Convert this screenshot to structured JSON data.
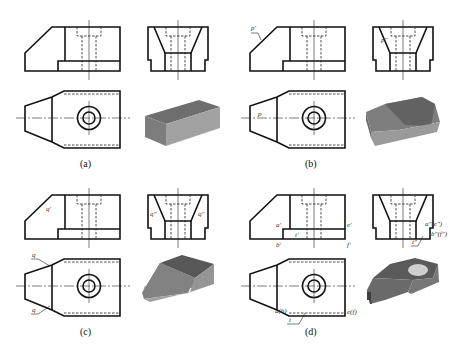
{
  "figure": {
    "panels": [
      {
        "id": "a",
        "caption": "(a)",
        "labels": []
      },
      {
        "id": "b",
        "caption": "(b)",
        "labels": {
          "front": "p'",
          "side": "p\"",
          "top": "p"
        }
      },
      {
        "id": "c",
        "caption": "(c)",
        "labels": {
          "front": "q'",
          "side_left": "q\"",
          "side_right": "q\"",
          "top_upper": "q",
          "top_lower": "q"
        }
      },
      {
        "id": "d",
        "caption": "(d)",
        "labels": {
          "front_a": "a'",
          "front_b": "b'",
          "front_t": "t'",
          "front_e": "e'",
          "front_f": "f'",
          "side_ae": "a\"(e\")",
          "side_bf": "b\"(f\")",
          "side_t": "t\"",
          "top_ab": "a(b)",
          "top_ef": "e(f)",
          "top_t": "t"
        }
      }
    ],
    "colors": {
      "line": "#111111",
      "solid_top": "#6e6e6e",
      "solid_front": "#9a9a9a",
      "solid_side": "#7d7d7d",
      "hole": "#c8c8c8"
    }
  }
}
